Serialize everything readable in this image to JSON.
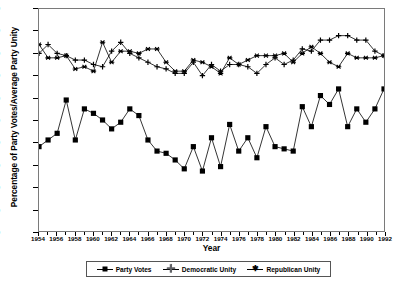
{
  "chart_data": {
    "type": "line",
    "title": "",
    "xlabel": "Year",
    "ylabel": "Percentage of Party Votes/Average Party Unity",
    "xlim": [
      1954,
      1992
    ],
    "ylim": [
      0,
      100
    ],
    "grid": false,
    "legend_position": "bottom",
    "x": [
      1954,
      1955,
      1956,
      1957,
      1958,
      1959,
      1960,
      1961,
      1962,
      1963,
      1964,
      1965,
      1966,
      1967,
      1968,
      1969,
      1970,
      1971,
      1972,
      1973,
      1974,
      1975,
      1976,
      1977,
      1978,
      1979,
      1980,
      1981,
      1982,
      1983,
      1984,
      1985,
      1986,
      1987,
      1988,
      1989,
      1990,
      1991,
      1992
    ],
    "xticks": [
      1954,
      1956,
      1958,
      1960,
      1962,
      1964,
      1966,
      1968,
      1970,
      1972,
      1974,
      1976,
      1978,
      1980,
      1982,
      1984,
      1986,
      1988,
      1990,
      1992
    ],
    "yticks": [
      0,
      10,
      20,
      30,
      40,
      50,
      60,
      70,
      80,
      90,
      100
    ],
    "series": [
      {
        "name": "Party Votes",
        "marker": "filled-square",
        "values": [
          38,
          41,
          44,
          59,
          41,
          55,
          53,
          50,
          46,
          49,
          55,
          52,
          41,
          36,
          35,
          32,
          28,
          38,
          27,
          42,
          29,
          48,
          36,
          42,
          33,
          47,
          38,
          37,
          36,
          56,
          47,
          61,
          57,
          64,
          47,
          55,
          49,
          55,
          64
        ]
      },
      {
        "name": "Democratic Unity",
        "marker": "plus",
        "values": [
          80,
          84,
          80,
          79,
          77,
          77,
          75,
          74,
          81,
          85,
          80,
          78,
          76,
          74,
          73,
          71,
          71,
          76,
          70,
          75,
          72,
          75,
          75,
          74,
          71,
          75,
          78,
          75,
          77,
          82,
          81,
          86,
          86,
          88,
          88,
          86,
          86,
          81,
          79
        ]
      },
      {
        "name": "Republican Unity",
        "marker": "asterisk",
        "values": [
          84,
          78,
          78,
          79,
          73,
          74,
          72,
          85,
          76,
          81,
          81,
          80,
          82,
          82,
          76,
          72,
          72,
          77,
          76,
          74,
          71,
          78,
          75,
          77,
          79,
          79,
          79,
          80,
          76,
          80,
          83,
          80,
          76,
          74,
          80,
          78,
          78,
          78,
          79
        ]
      }
    ]
  },
  "legend": {
    "items": [
      {
        "label": "Party Votes",
        "marker": "filled-square"
      },
      {
        "label": "Democratic Unity",
        "marker": "plus"
      },
      {
        "label": "Republican Unity",
        "marker": "asterisk"
      }
    ]
  }
}
